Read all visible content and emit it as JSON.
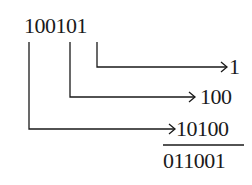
{
  "diagram": {
    "source_number": "100101",
    "terms": [
      {
        "label": "1",
        "from_digit_index": 5
      },
      {
        "label": "100",
        "from_digit_index": 3
      },
      {
        "label": "10100",
        "from_digit_index": 0
      }
    ],
    "result": "011001",
    "line_color": "#1a1a1a"
  }
}
